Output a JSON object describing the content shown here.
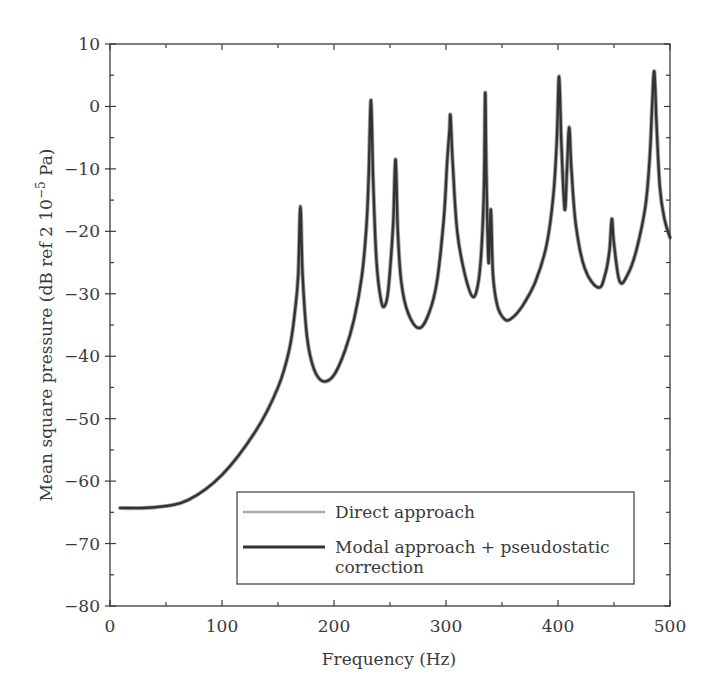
{
  "chart_data": {
    "type": "line",
    "title": "",
    "xlabel": "Frequency (Hz)",
    "ylabel": "Mean square pressure (dB ref 2 10⁻⁵ Pa)",
    "ylabel_parts": {
      "main": "Mean square pressure (dB ref 2 10",
      "sup": "−5",
      "tail": " Pa)"
    },
    "xlim": [
      0,
      500
    ],
    "ylim": [
      -80,
      10
    ],
    "xticks": [
      0,
      100,
      200,
      300,
      400,
      500
    ],
    "xtick_labels": [
      "0",
      "100",
      "200",
      "300",
      "400",
      "500"
    ],
    "yticks": [
      10,
      0,
      -10,
      -20,
      -30,
      -40,
      -50,
      -60,
      -70,
      -80
    ],
    "ytick_labels": [
      "10",
      "0",
      "−10",
      "−20",
      "−30",
      "−40",
      "−50",
      "−60",
      "−70",
      "−80"
    ],
    "grid": false,
    "legend_position": "lower right",
    "legend": [
      {
        "label": "Direct approach",
        "color": "#a8a8a8"
      },
      {
        "label_line1": "Modal approach + pseudostatic",
        "label_line2": "correction",
        "label": "Modal approach + pseudostatic correction",
        "color": "#333333"
      }
    ],
    "series": [
      {
        "name": "Direct approach",
        "color": "#a8a8a8",
        "x": [
          9,
          40,
          70,
          100,
          130,
          150,
          160,
          165,
          168,
          170,
          172,
          176,
          182,
          190,
          200,
          210,
          218,
          225,
          229,
          231,
          233,
          235,
          238,
          242,
          245,
          248,
          251,
          253,
          255,
          257,
          260,
          266,
          276,
          285,
          292,
          298,
          301,
          303,
          304,
          306,
          310,
          317,
          324,
          329,
          332,
          334,
          335,
          336,
          338,
          340,
          342,
          346,
          352,
          358,
          368,
          380,
          390,
          396,
          399,
          401,
          403,
          406,
          408,
          410,
          412,
          416,
          424,
          436,
          442,
          446,
          448,
          450,
          455,
          462,
          470,
          478,
          482,
          484,
          486,
          488,
          491,
          495,
          500
        ],
        "y": [
          -64.3,
          -64.2,
          -63,
          -59,
          -52,
          -45,
          -39,
          -33,
          -27,
          -16,
          -27,
          -37,
          -42,
          -44,
          -43,
          -39,
          -34,
          -27,
          -19,
          -11,
          1,
          -12,
          -25,
          -31,
          -32,
          -30,
          -24,
          -18,
          -8.5,
          -20,
          -28,
          -33,
          -35.5,
          -33,
          -28,
          -18,
          -9,
          -4,
          -1.5,
          -9,
          -20,
          -27,
          -30.5,
          -28,
          -22,
          -12,
          2.2,
          -10,
          -25,
          -16.5,
          -27,
          -32,
          -34,
          -34,
          -32,
          -28,
          -22,
          -14,
          -5,
          4.8,
          -6,
          -16.5,
          -10,
          -3.3,
          -10,
          -19,
          -26,
          -29,
          -27,
          -23,
          -18,
          -22,
          -28,
          -27,
          -23,
          -16,
          -8,
          0,
          5.6,
          -3,
          -13,
          -18,
          -21
        ]
      },
      {
        "name": "Modal approach + pseudostatic correction",
        "color": "#333333",
        "x": [
          9,
          40,
          70,
          100,
          130,
          150,
          160,
          165,
          168,
          170,
          172,
          176,
          182,
          190,
          200,
          210,
          218,
          225,
          229,
          231,
          233,
          235,
          238,
          242,
          245,
          248,
          251,
          253,
          255,
          257,
          260,
          266,
          276,
          285,
          292,
          298,
          301,
          303,
          304,
          306,
          310,
          317,
          324,
          329,
          332,
          334,
          335,
          336,
          338,
          340,
          342,
          346,
          352,
          358,
          368,
          380,
          390,
          396,
          399,
          401,
          403,
          406,
          408,
          410,
          412,
          416,
          424,
          436,
          442,
          446,
          448,
          450,
          455,
          462,
          470,
          478,
          482,
          484,
          486,
          488,
          491,
          495,
          500
        ],
        "y": [
          -64.3,
          -64.2,
          -63,
          -59,
          -52,
          -45,
          -39,
          -33,
          -27,
          -16,
          -27,
          -37,
          -42,
          -44,
          -43,
          -39,
          -34,
          -27,
          -19,
          -11,
          1,
          -12,
          -25,
          -31,
          -32,
          -30,
          -24,
          -18,
          -8.5,
          -20,
          -28,
          -33,
          -35.5,
          -33,
          -28,
          -18,
          -9,
          -4,
          -1.5,
          -9,
          -20,
          -27,
          -30.5,
          -28,
          -22,
          -12,
          2.2,
          -10,
          -25,
          -16.5,
          -27,
          -32,
          -34,
          -34,
          -32,
          -28,
          -22,
          -14,
          -5,
          4.8,
          -6,
          -16.5,
          -10,
          -3.3,
          -10,
          -19,
          -26,
          -29,
          -27,
          -23,
          -18,
          -22,
          -28,
          -27,
          -23,
          -16,
          -8,
          0,
          5.6,
          -3,
          -13,
          -18,
          -21
        ]
      }
    ]
  },
  "colors": {
    "axis": "#3a3a3a",
    "text": "#3a3a3a",
    "background": "#ffffff"
  }
}
